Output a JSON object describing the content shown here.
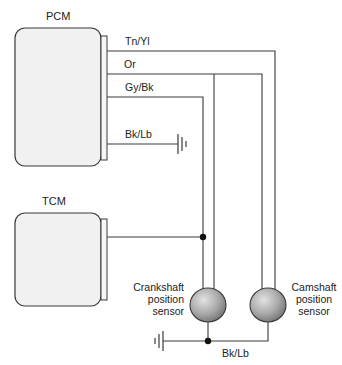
{
  "modules": {
    "pcm": {
      "label": "PCM"
    },
    "tcm": {
      "label": "TCM"
    }
  },
  "wires": {
    "tn_yl": "Tn/Yl",
    "or": "Or",
    "gy_bk": "Gy/Bk",
    "bk_lb_pcm": "Bk/Lb",
    "bk_lb_sensors": "Bk/Lb"
  },
  "sensors": {
    "crankshaft": {
      "line1": "Crankshaft",
      "line2": "position",
      "line3": "sensor"
    },
    "camshaft": {
      "line1": "Camshaft",
      "line2": "position",
      "line3": "sensor"
    }
  },
  "colors": {
    "line": "#3a3a3a",
    "module_fill": "#f1f1f1",
    "sensor_light": "#d8d8d8",
    "sensor_dark": "#6e6e6e"
  }
}
